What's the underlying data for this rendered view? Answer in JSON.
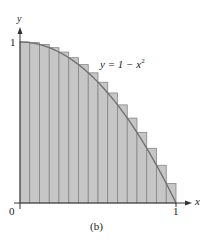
{
  "chart_data": {
    "type": "bar",
    "subtype": "riemann-sum-rectangles-with-curve",
    "title": "",
    "caption": "(b)",
    "curve_label": "y = 1 − x²",
    "curve": "y = 1 - x^2",
    "xlabel": "x",
    "ylabel": "y",
    "xlim": [
      0,
      1
    ],
    "ylim": [
      0,
      1
    ],
    "x_tick_labels": [
      "0",
      "1"
    ],
    "y_tick_labels": [
      "1"
    ],
    "grid": false,
    "legend": null,
    "n_rectangles": 16,
    "sample_point": "left endpoint",
    "rect_width": 0.0625,
    "x_left": [
      0,
      0.0625,
      0.125,
      0.1875,
      0.25,
      0.3125,
      0.375,
      0.4375,
      0.5,
      0.5625,
      0.625,
      0.6875,
      0.75,
      0.8125,
      0.875,
      0.9375
    ],
    "values": [
      1.0,
      0.9961,
      0.9844,
      0.9648,
      0.9375,
      0.9023,
      0.8594,
      0.8086,
      0.75,
      0.6836,
      0.6094,
      0.5273,
      0.4375,
      0.3398,
      0.2344,
      0.1211
    ],
    "colors": {
      "fill": "#c6c6c6",
      "edge": "#858585",
      "curve": "#6e6e6e",
      "axis": "#333333"
    }
  },
  "labels": {
    "y_axis": "y",
    "x_axis": "x",
    "origin": "0",
    "x_one": "1",
    "y_one": "1",
    "curve_prefix": "y = 1 − x",
    "curve_exp": "2",
    "caption": "(b)"
  }
}
